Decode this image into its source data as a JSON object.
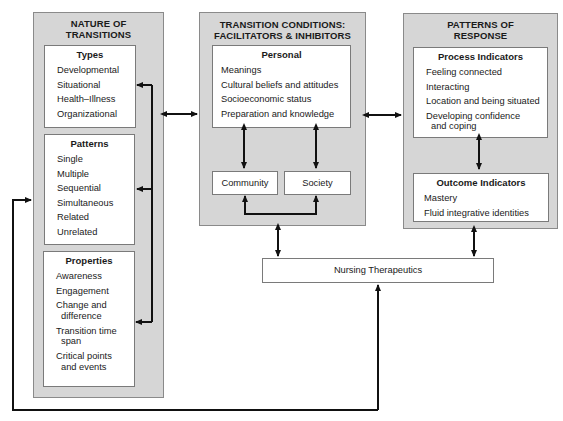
{
  "nature": {
    "title_line1": "NATURE OF",
    "title_line2": "TRANSITIONS",
    "types": {
      "title": "Types",
      "items": [
        "Developmental",
        "Situational",
        "Health–Illness",
        "Organizational"
      ]
    },
    "patterns": {
      "title": "Patterns",
      "items": [
        "Single",
        "Multiple",
        "Sequential",
        "Simultaneous",
        "Related",
        "Unrelated"
      ]
    },
    "properties": {
      "title": "Properties",
      "items": [
        {
          "line1": "Awareness",
          "line2": ""
        },
        {
          "line1": "Engagement",
          "line2": ""
        },
        {
          "line1": "Change and",
          "line2": "difference"
        },
        {
          "line1": "Transition time",
          "line2": "span"
        },
        {
          "line1": "Critical points",
          "line2": "and events"
        }
      ]
    }
  },
  "conditions": {
    "title_line1": "TRANSITION CONDITIONS:",
    "title_line2": "FACILITATORS & INHIBITORS",
    "personal": {
      "title": "Personal",
      "items": [
        "Meanings",
        "Cultural beliefs and attitudes",
        "Socioeconomic status",
        "Preparation and knowledge"
      ]
    },
    "community": "Community",
    "society": "Society"
  },
  "response": {
    "title_line1": "PATTERNS OF",
    "title_line2": "RESPONSE",
    "process": {
      "title": "Process Indicators",
      "items": [
        {
          "line1": "Feeling connected",
          "line2": ""
        },
        {
          "line1": "Interacting",
          "line2": ""
        },
        {
          "line1": "Location and being situated",
          "line2": ""
        },
        {
          "line1": "Developing confidence",
          "line2": "and coping"
        }
      ]
    },
    "outcome": {
      "title": "Outcome Indicators",
      "items": [
        "Mastery",
        "Fluid integrative identities"
      ]
    }
  },
  "therapeutics": {
    "label": "Nursing Therapeutics"
  },
  "colors": {
    "outer_fill": "#d6d6d6",
    "inner_fill": "#ffffff",
    "line": "#111111"
  }
}
